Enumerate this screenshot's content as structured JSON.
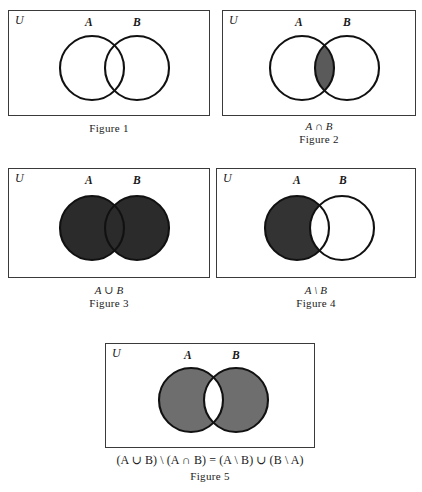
{
  "page": {
    "background_color": "#ffffff",
    "ink_color": "#1a1a1a",
    "box_border_color": "#3a3a3a",
    "circle_stroke_color": "#111111"
  },
  "labels": {
    "universe": "U",
    "set_a": "A",
    "set_b": "B"
  },
  "figures": [
    {
      "id": "figure-1",
      "name": "Figure 1",
      "universe_label": "U",
      "label_a": "A",
      "label_b": "B",
      "expression": "",
      "caption": "Figure 1",
      "shading": "none",
      "shade_color": "#ffffff",
      "description": "Two overlapping circles A and B inside rectangle U, no region shaded"
    },
    {
      "id": "figure-2",
      "name": "Figure 2",
      "universe_label": "U",
      "label_a": "A",
      "label_b": "B",
      "expression": "A ∩ B",
      "caption": "Figure 2",
      "shading": "intersection",
      "shade_color": "#5a5a5a",
      "description": "Lens-shaped intersection of A and B shaded"
    },
    {
      "id": "figure-3",
      "name": "Figure 3",
      "universe_label": "U",
      "label_a": "A",
      "label_b": "B",
      "expression": "A ∪ B",
      "caption": "Figure 3",
      "shading": "union",
      "shade_color": "#2b2b2b",
      "description": "Both circles fully shaded"
    },
    {
      "id": "figure-4",
      "name": "Figure 4",
      "universe_label": "U",
      "label_a": "A",
      "label_b": "B",
      "expression": "A \\ B",
      "caption": "Figure 4",
      "shading": "a-minus-b",
      "shade_color": "#333333",
      "description": "Circle A shaded except the overlap with B"
    },
    {
      "id": "figure-5",
      "name": "Figure 5",
      "universe_label": "U",
      "label_a": "A",
      "label_b": "B",
      "expression": "(A ∪ B) \\ (A ∩ B) = (A \\ B) ∪ (B \\ A)",
      "caption": "Figure 5",
      "shading": "symmetric-difference",
      "shade_color": "#6e6e6e",
      "description": "Both circles shaded except the overlapping lens"
    }
  ],
  "figure5_formula": {
    "part1_open": "(",
    "part1_a": "A",
    "part1_union": " ∪ ",
    "part1_b": "B",
    "part1_close": ")",
    "setminus1": " \\ ",
    "part2_open": "(",
    "part2_a": "A",
    "part2_inter": " ∩ ",
    "part2_b": "B",
    "part2_close": ")",
    "equals": " = ",
    "part3_open": "(",
    "part3_a": "A",
    "part3_minus": " \\ ",
    "part3_b": "B",
    "part3_close": ")",
    "union2": " ∪ ",
    "part4_open": "(",
    "part4_b": "B",
    "part4_minus": " \\ ",
    "part4_a": "A",
    "part4_close": ")"
  }
}
